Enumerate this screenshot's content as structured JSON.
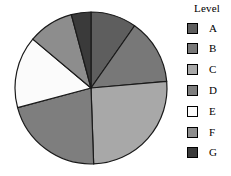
{
  "chart_data": {
    "type": "pie",
    "title": "",
    "legend_title": "Level",
    "legend_position": "right",
    "start_angle_deg": 0,
    "direction": "clockwise",
    "categories": [
      "A",
      "B",
      "C",
      "D",
      "E",
      "F",
      "G"
    ],
    "values": [
      9.7,
      13.9,
      25.8,
      21.4,
      15.3,
      9.7,
      4.2
    ],
    "angles_deg": [
      35,
      50,
      93,
      77,
      55,
      35,
      15
    ],
    "slice_boundaries_deg": [
      0,
      35,
      85,
      178,
      255,
      310,
      345,
      360
    ],
    "colors": [
      "#5e5e5e",
      "#787878",
      "#a8a8a8",
      "#7e7e7e",
      "#fbfbfb",
      "#8d8d8d",
      "#3a3a3a"
    ],
    "edge_color": "#1a1a1a",
    "xlabel": "",
    "ylabel": ""
  },
  "legend": {
    "title": "Level",
    "items": [
      {
        "label": "A",
        "color": "#5e5e5e"
      },
      {
        "label": "B",
        "color": "#787878"
      },
      {
        "label": "C",
        "color": "#a8a8a8"
      },
      {
        "label": "D",
        "color": "#7e7e7e"
      },
      {
        "label": "E",
        "color": "#fbfbfb"
      },
      {
        "label": "F",
        "color": "#8d8d8d"
      },
      {
        "label": "G",
        "color": "#3a3a3a"
      }
    ]
  },
  "pie": {
    "center_x": 78,
    "center_y": 80,
    "radius": 76
  }
}
